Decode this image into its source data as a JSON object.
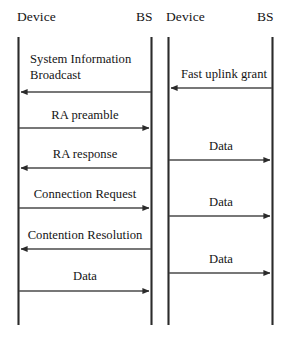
{
  "figure": {
    "kind": "sequence-diagram",
    "background_color": "#ffffff",
    "line_color": "#2b2b2b",
    "text_color": "#141414",
    "width": 292,
    "height": 345
  },
  "panels": [
    {
      "id": "left-panel",
      "name": "random-access-procedure",
      "actors": [
        {
          "id": "left-device",
          "label": "Device",
          "x": 18
        },
        {
          "id": "left-bs",
          "label": "BS",
          "x": 151
        }
      ],
      "messages": [
        {
          "id": "msg-system-information-broadcast",
          "label": "System Information\nBroadcast",
          "label_line1": "System Information",
          "label_line2": "Broadcast",
          "direction": "left",
          "from": "left-bs",
          "to": "left-device",
          "y": 92
        },
        {
          "id": "msg-ra-preamble",
          "label": "RA preamble",
          "direction": "right",
          "from": "left-device",
          "to": "left-bs",
          "y": 128
        },
        {
          "id": "msg-ra-response",
          "label": "RA response",
          "direction": "left",
          "from": "left-bs",
          "to": "left-device",
          "y": 168
        },
        {
          "id": "msg-connection-request",
          "label": "Connection Request",
          "direction": "right",
          "from": "left-device",
          "to": "left-bs",
          "y": 208
        },
        {
          "id": "msg-contention-resolution",
          "label": "Contention Resolution",
          "direction": "left",
          "from": "left-bs",
          "to": "left-device",
          "y": 249
        },
        {
          "id": "msg-data-left",
          "label": "Data",
          "direction": "right",
          "from": "left-device",
          "to": "left-bs",
          "y": 291
        }
      ]
    },
    {
      "id": "right-panel",
      "name": "fast-uplink-grant-procedure",
      "actors": [
        {
          "id": "right-device",
          "label": "Device",
          "x": 168
        },
        {
          "id": "right-bs",
          "label": "BS",
          "x": 272
        }
      ],
      "messages": [
        {
          "id": "msg-fast-uplink-grant",
          "label": "Fast uplink grant",
          "direction": "left",
          "from": "right-bs",
          "to": "right-device",
          "y": 88
        },
        {
          "id": "msg-data-right-1",
          "label": "Data",
          "direction": "right",
          "from": "right-device",
          "to": "right-bs",
          "y": 160
        },
        {
          "id": "msg-data-right-2",
          "label": "Data",
          "direction": "right",
          "from": "right-device",
          "to": "right-bs",
          "y": 216
        },
        {
          "id": "msg-data-right-3",
          "label": "Data",
          "direction": "right",
          "from": "right-device",
          "to": "right-bs",
          "y": 273
        }
      ]
    }
  ],
  "lifelines": {
    "top_y": 37,
    "bottom_y": 325
  },
  "labels": {
    "left_device": "Device",
    "left_bs": "BS",
    "right_device": "Device",
    "right_bs": "BS",
    "system_information_broadcast_line1": "System Information",
    "system_information_broadcast_line2": "Broadcast",
    "ra_preamble": "RA preamble",
    "ra_response": "RA response",
    "connection_request": "Connection Request",
    "contention_resolution": "Contention Resolution",
    "data_left": "Data",
    "fast_uplink_grant": "Fast uplink grant",
    "data_right_1": "Data",
    "data_right_2": "Data",
    "data_right_3": "Data"
  }
}
